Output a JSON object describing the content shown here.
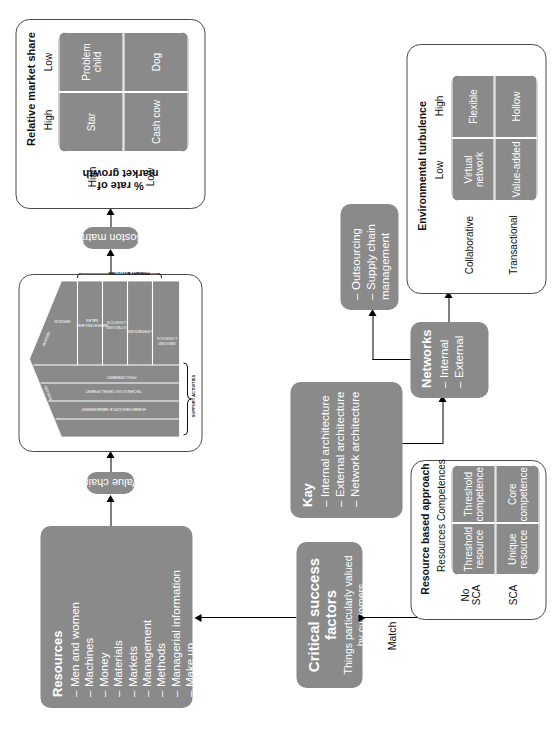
{
  "diagram": {
    "colors": {
      "box_fill": "#8a8a8a",
      "box_text": "#ffffff",
      "outline": "#4a4a4a",
      "page": "#ffffff"
    }
  },
  "resources": {
    "title": "Resources",
    "items": [
      "Men and women",
      "Machines",
      "Money",
      "Materials",
      "Markets",
      "Management",
      "Methods",
      "Managerial information",
      "Make up"
    ]
  },
  "value_chain": {
    "label": "Value chain",
    "margin_left": "MARGIN",
    "margin_right": "MARGIN",
    "support_caption": "SUPPORT ACTIVITIES",
    "primary_caption": "PRIMARY ACTIVITIES",
    "support_activities": [
      "FIRM INFRASTRUCTURE",
      "HUMAN RESOURCE MANAGEMENT",
      "TECHNOLOGY DEVELOPMENT",
      "PROCUREMENT"
    ],
    "primary_activities": [
      "INBOUND LOGISTICS",
      "OPERATIONS",
      "OUTBOUND LOGISTICS",
      "MARKETING AND SALES",
      "SERVICE"
    ]
  },
  "boston": {
    "label": "Boston matrix",
    "x_title": "Relative market share",
    "x_ticks": [
      "High",
      "Low"
    ],
    "y_title": "% rate of\nmarket growth",
    "y_title_line1": "% rate of",
    "y_title_line2": "market growth",
    "y_ticks": [
      "High",
      "Low"
    ],
    "cells": [
      "Star",
      "Problem\nchild",
      "Cash\ncow",
      "Dog"
    ],
    "cell_star": "Star",
    "cell_problem_child": "Problem child",
    "cell_cash_cow": "Cash cow",
    "cell_dog": "Dog"
  },
  "csf": {
    "title": "Critical success factors",
    "subtitle_line1": "Things particularly valued",
    "subtitle_line2": "by customers"
  },
  "kay": {
    "title": "Kay",
    "items": [
      "Internal architecture",
      "External architecture",
      "Network architecture"
    ]
  },
  "rba": {
    "title": "Resource based approach",
    "col_headers": [
      "Resources",
      "Competences"
    ],
    "row_headers": [
      "No\nSCA",
      "SCA"
    ],
    "row_header_1_line1": "No",
    "row_header_1_line2": "SCA",
    "row_header_2": "SCA",
    "cells": [
      "Threshold resource",
      "Threshold competence",
      "Unique resource",
      "Core competence"
    ],
    "cell_threshold_resource": "Threshold resource",
    "cell_threshold_competence": "Threshold competence",
    "cell_unique_resource": "Unique resource",
    "cell_core_competence": "Core competence",
    "match_label": "Match"
  },
  "networks": {
    "title": "Networks",
    "items": [
      "Internal",
      "External"
    ]
  },
  "outsourcing": {
    "items": [
      "Outsourcing",
      "Supply chain management"
    ],
    "item_1": "Outsourcing",
    "item_2": "Supply chain management"
  },
  "turbulence": {
    "title": "Environmental turbulence",
    "x_ticks": [
      "Low",
      "High"
    ],
    "row_headers": [
      "Collaborative",
      "Transactional"
    ],
    "cells": [
      "Virtual network",
      "Flexible",
      "Value-added",
      "Hollow"
    ],
    "cell_virtual_network": "Virtual network",
    "cell_flexible": "Flexible",
    "cell_value_added": "Value-added",
    "cell_hollow": "Hollow"
  }
}
